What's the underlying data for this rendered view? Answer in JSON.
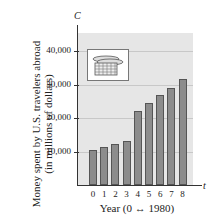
{
  "chart_data": {
    "type": "bar",
    "title": "",
    "xlabel": "Year (0 ↔ 1980)",
    "ylabel": "Money spent by U.S. travelers abroad (in millions of dollars)",
    "y_axis_symbol": "C",
    "x_axis_symbol": "t",
    "categories": [
      "0",
      "1",
      "2",
      "3",
      "4",
      "5",
      "6",
      "7",
      "8"
    ],
    "values": [
      10400,
      11300,
      12200,
      13100,
      22100,
      24500,
      26900,
      29100,
      31500
    ],
    "yticks": [
      "10,000",
      "20,000",
      "30,000",
      "40,000"
    ],
    "ylim": [
      0,
      45000
    ],
    "grid": true,
    "legend": null,
    "inset_icon": "stack-of-coins-icon"
  },
  "labels": {
    "ylabel_line1": "Money spent by U.S. travelers abroad",
    "ylabel_line2": "(in millions of dollars)",
    "xlabel": "Year (0 ↔ 1980)",
    "y_symbol": "C",
    "x_symbol": "t"
  }
}
